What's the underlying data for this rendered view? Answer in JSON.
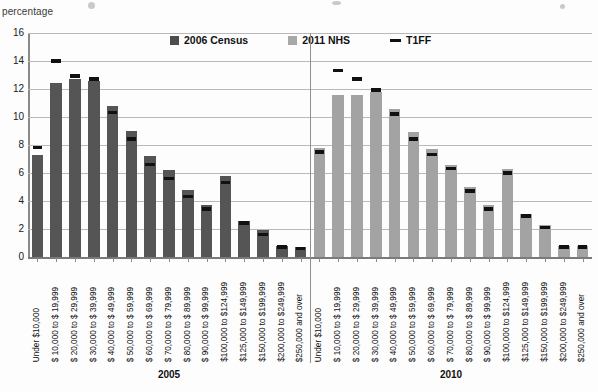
{
  "axis": {
    "y_label": "percentage",
    "y_ticks": [
      0,
      2,
      4,
      6,
      8,
      10,
      12,
      14,
      16
    ]
  },
  "legend": {
    "items": [
      {
        "label": "2006 Census",
        "color": "#555555",
        "marker": "square"
      },
      {
        "label": "2011 NHS",
        "color": "#a3a3a3",
        "marker": "square"
      },
      {
        "label": "T1FF",
        "color": "#111111",
        "marker": "line"
      }
    ]
  },
  "groups": [
    {
      "label": "2005"
    },
    {
      "label": "2010"
    }
  ],
  "categories": [
    "Under $10,000",
    "$ 10,000 to $ 19,999",
    "$ 20,000 to $ 29,999",
    "$ 30,000 to $ 39,999",
    "$ 40,000 to $ 49,999",
    "$ 50,000 to $ 59,999",
    "$ 60,000 to $ 69,999",
    "$ 70,000 to $ 79,999",
    "$ 80,000 to $ 89,999",
    "$ 90,000 to $ 99,999",
    "$100,000 to $124,999",
    "$125,000 to $149,999",
    "$150,000 to $199,999",
    "$200,000 to $249,999",
    "$250,000 and over"
  ],
  "chart_data": {
    "type": "bar",
    "title": "",
    "xlabel": "",
    "ylabel": "percentage",
    "ylim": [
      0,
      16
    ],
    "grid": true,
    "legend_position": "top-center",
    "categories": [
      "Under $10,000",
      "$ 10,000 to $ 19,999",
      "$ 20,000 to $ 29,999",
      "$ 30,000 to $ 39,999",
      "$ 40,000 to $ 49,999",
      "$ 50,000 to $ 59,999",
      "$ 60,000 to $ 69,999",
      "$ 70,000 to $ 79,999",
      "$ 80,000 to $ 89,999",
      "$ 90,000 to $ 99,999",
      "$100,000 to $124,999",
      "$125,000 to $149,999",
      "$150,000 to $199,999",
      "$200,000 to $249,999",
      "$250,000 and over"
    ],
    "groups": [
      {
        "name": "2005",
        "series": [
          {
            "name": "2006 Census",
            "type": "bar",
            "color": "#555555",
            "values": [
              7.3,
              12.4,
              12.7,
              12.6,
              10.8,
              9.0,
              7.2,
              6.2,
              4.8,
              3.7,
              5.8,
              2.6,
              1.9,
              0.8,
              0.7
            ]
          },
          {
            "name": "T1FF",
            "type": "marker",
            "color": "#111111",
            "values": [
              7.8,
              14.0,
              12.9,
              12.7,
              10.3,
              8.4,
              6.6,
              5.6,
              4.3,
              3.4,
              5.3,
              2.4,
              1.6,
              0.7,
              0.6
            ]
          }
        ]
      },
      {
        "name": "2010",
        "series": [
          {
            "name": "2011 NHS",
            "type": "bar",
            "color": "#a3a3a3",
            "values": [
              7.8,
              11.6,
              11.6,
              11.8,
              10.6,
              8.9,
              7.7,
              6.6,
              5.0,
              3.7,
              6.3,
              3.1,
              2.3,
              0.8,
              0.8
            ]
          },
          {
            "name": "T1FF",
            "type": "marker",
            "color": "#111111",
            "values": [
              7.5,
              13.3,
              12.7,
              11.9,
              10.2,
              8.4,
              7.3,
              6.3,
              4.7,
              3.4,
              6.0,
              2.9,
              2.1,
              0.7,
              0.7
            ]
          }
        ]
      }
    ]
  }
}
